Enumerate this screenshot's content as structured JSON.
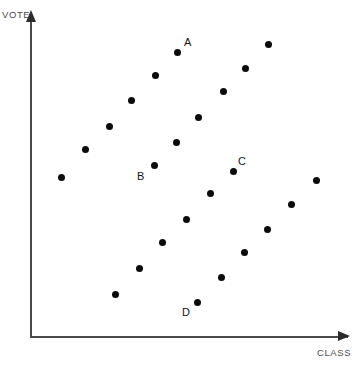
{
  "figure": {
    "width": 364,
    "height": 366,
    "background": "#ffffff",
    "point_color": "#0b0b0b",
    "axis_color": "#4a4a4a",
    "label_color": "#4d4d4d"
  },
  "axes": {
    "y_title": "VOTE",
    "x_title": "CLASS"
  },
  "chart_data": {
    "type": "scatter",
    "title": "",
    "xlabel": "CLASS",
    "ylabel": "VOTE",
    "grid": false,
    "legend": null,
    "axis_style": "open arrows, no tick marks, no tick labels",
    "xlim": [
      0,
      1
    ],
    "ylim": [
      0,
      1
    ],
    "note": "Axes are unlabeled/unscaled; point positions are given in pixel coordinates of the 364x366 figure (px_x, px_y) and as normalized data coordinates (x, y) where x=0,y=0 is the axis origin at pixel (30,336) and x=1,y=1 is at pixel (348,20).",
    "marker": "filled circle",
    "marker_size_px": 7,
    "series": [
      {
        "name": "band-1",
        "points": [
          {
            "px_x": 61,
            "px_y": 177,
            "x": 0.097,
            "y": 0.503,
            "label": ""
          },
          {
            "px_x": 85,
            "px_y": 149,
            "x": 0.173,
            "y": 0.592,
            "label": ""
          },
          {
            "px_x": 109,
            "px_y": 126,
            "x": 0.248,
            "y": 0.665,
            "label": ""
          },
          {
            "px_x": 131,
            "px_y": 100,
            "x": 0.318,
            "y": 0.747,
            "label": ""
          },
          {
            "px_x": 155,
            "px_y": 75,
            "x": 0.393,
            "y": 0.826,
            "label": ""
          },
          {
            "px_x": 177,
            "px_y": 52,
            "x": 0.462,
            "y": 0.899,
            "label": "A"
          }
        ]
      },
      {
        "name": "band-2",
        "points": [
          {
            "px_x": 154,
            "px_y": 165,
            "x": 0.39,
            "y": 0.541,
            "label": "B"
          },
          {
            "px_x": 176,
            "px_y": 142,
            "x": 0.459,
            "y": 0.614,
            "label": ""
          },
          {
            "px_x": 198,
            "px_y": 117,
            "x": 0.528,
            "y": 0.693,
            "label": ""
          },
          {
            "px_x": 223,
            "px_y": 91,
            "x": 0.607,
            "y": 0.775,
            "label": ""
          },
          {
            "px_x": 245,
            "px_y": 68,
            "x": 0.676,
            "y": 0.848,
            "label": ""
          },
          {
            "px_x": 268,
            "px_y": 44,
            "x": 0.748,
            "y": 0.924,
            "label": ""
          }
        ]
      },
      {
        "name": "band-3",
        "points": [
          {
            "px_x": 115,
            "px_y": 294,
            "x": 0.267,
            "y": 0.133,
            "label": ""
          },
          {
            "px_x": 139,
            "px_y": 268,
            "x": 0.343,
            "y": 0.215,
            "label": ""
          },
          {
            "px_x": 162,
            "px_y": 242,
            "x": 0.415,
            "y": 0.297,
            "label": ""
          },
          {
            "px_x": 186,
            "px_y": 219,
            "x": 0.491,
            "y": 0.37,
            "label": ""
          },
          {
            "px_x": 210,
            "px_y": 193,
            "x": 0.566,
            "y": 0.453,
            "label": ""
          },
          {
            "px_x": 233,
            "px_y": 171,
            "x": 0.638,
            "y": 0.522,
            "label": "C"
          }
        ]
      },
      {
        "name": "band-4",
        "points": [
          {
            "px_x": 197,
            "px_y": 302,
            "x": 0.525,
            "y": 0.108,
            "label": "D"
          },
          {
            "px_x": 221,
            "px_y": 277,
            "x": 0.601,
            "y": 0.187,
            "label": ""
          },
          {
            "px_x": 244,
            "px_y": 252,
            "x": 0.673,
            "y": 0.266,
            "label": ""
          },
          {
            "px_x": 267,
            "px_y": 229,
            "x": 0.745,
            "y": 0.339,
            "label": ""
          },
          {
            "px_x": 291,
            "px_y": 204,
            "x": 0.821,
            "y": 0.418,
            "label": ""
          },
          {
            "px_x": 316,
            "px_y": 180,
            "x": 0.899,
            "y": 0.494,
            "label": ""
          }
        ]
      }
    ]
  },
  "annotations": [
    {
      "text": "A",
      "px_x": 184,
      "px_y": 37
    },
    {
      "text": "B",
      "px_x": 137,
      "px_y": 171
    },
    {
      "text": "C",
      "px_x": 238,
      "px_y": 156
    },
    {
      "text": "D",
      "px_x": 182,
      "px_y": 307
    }
  ]
}
